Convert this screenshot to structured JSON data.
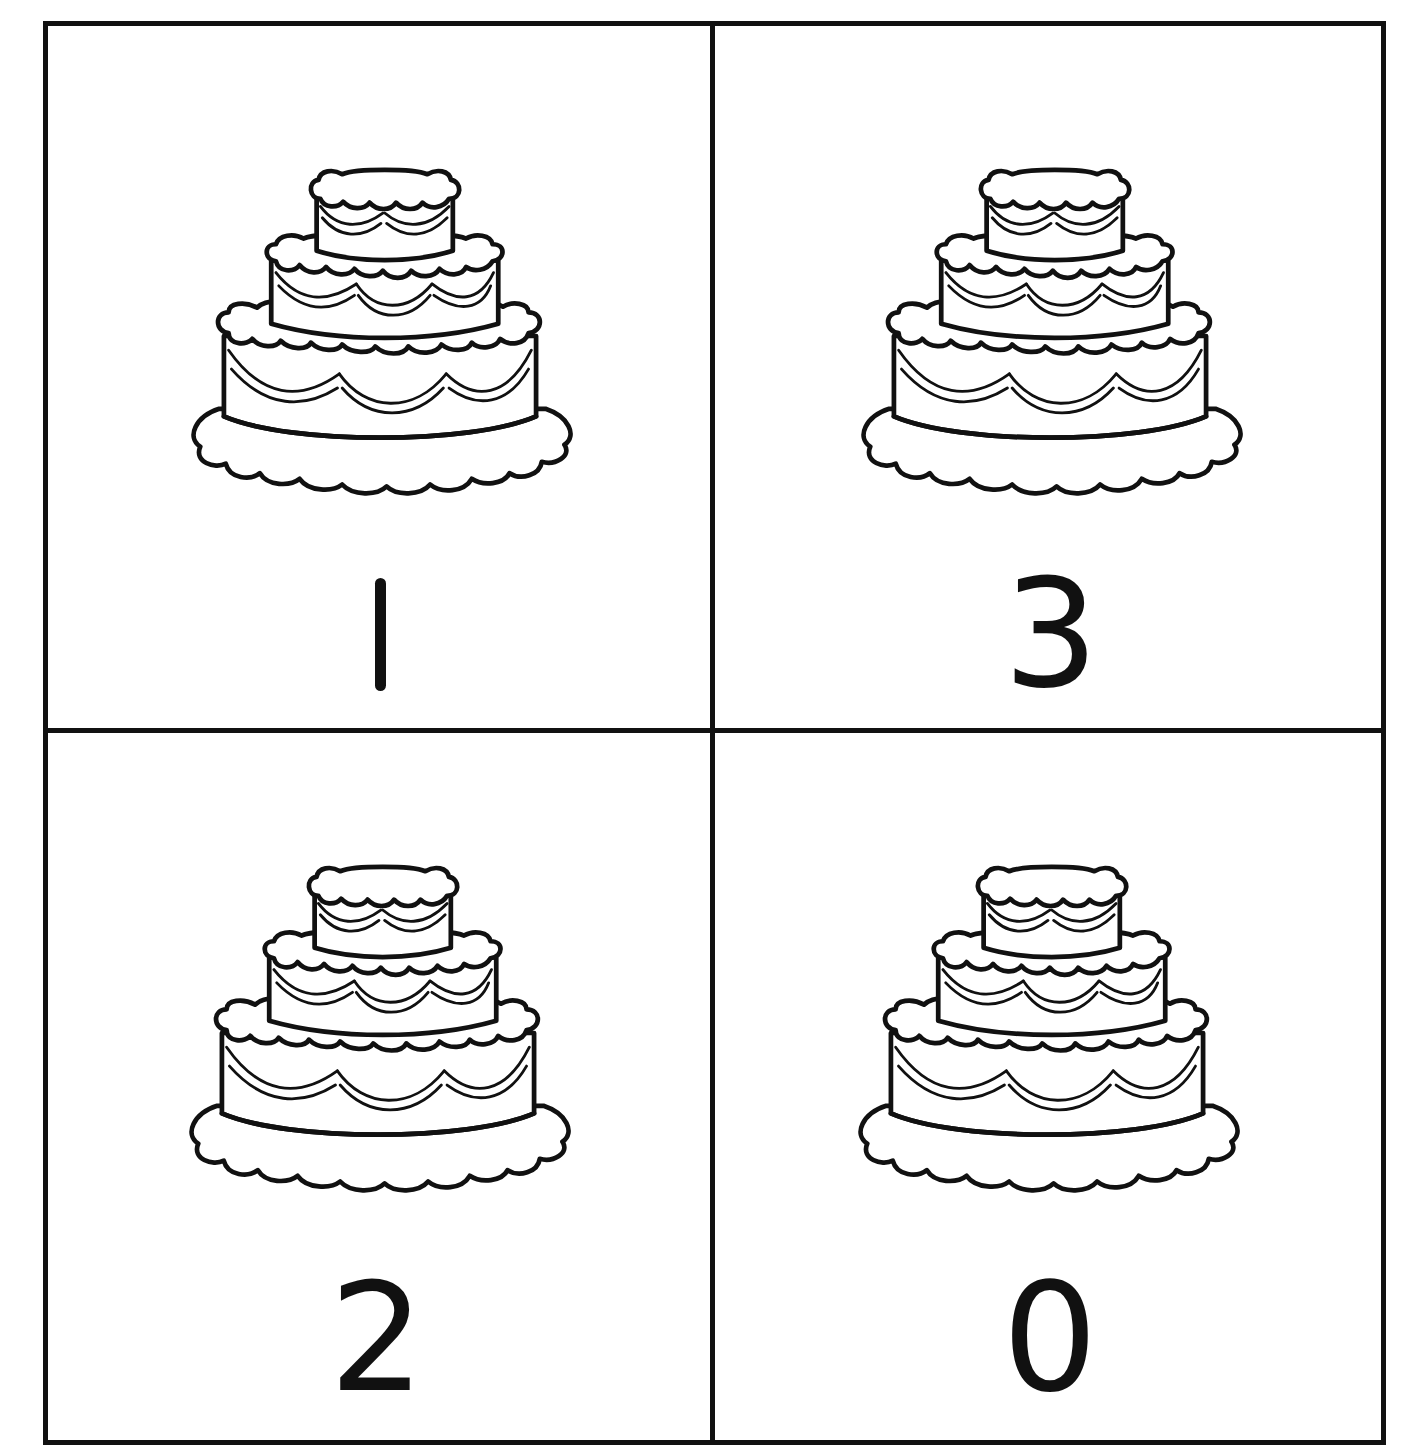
{
  "worksheet": {
    "type": "number cards",
    "layout": "2x2 grid",
    "stroke_color": "#111111",
    "background_color": "#ffffff",
    "cards": [
      {
        "position": "top-left",
        "image": "three-tier-cake",
        "number": "1"
      },
      {
        "position": "top-right",
        "image": "three-tier-cake",
        "number": "3"
      },
      {
        "position": "bottom-left",
        "image": "three-tier-cake",
        "number": "2"
      },
      {
        "position": "bottom-right",
        "image": "three-tier-cake",
        "number": "0"
      }
    ]
  }
}
